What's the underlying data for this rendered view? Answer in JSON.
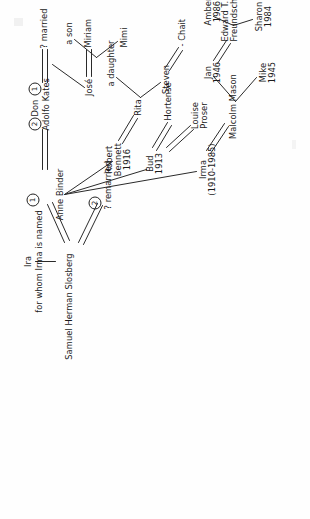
{
  "document": {
    "kind": "hand-drawn genealogy chart",
    "orientation": "rotated 90 degrees counter-clockwise on the page"
  },
  "people": {
    "ira": "Ira",
    "ira_note": "for whom Irma is named",
    "samuel": "Samuel Herman Slosberg",
    "remarried": "? remarried",
    "anne": "Anne Binder",
    "don": "Don",
    "adolfo": "Adolfo Kates",
    "qmarried": "? married",
    "jose": "José",
    "miriam": "Miriam",
    "mimi": "Mimi",
    "a_son": "a son",
    "robert": "Robert",
    "bennett": "Bennett",
    "bennett_year": "1916",
    "rita": "Rita",
    "steven": "Steven",
    "chait": "- Chait",
    "a_daughter": "a daughter",
    "bud": "Bud",
    "bud_year": "1913",
    "hortense": "Hortense",
    "louise": "Louise",
    "proser": "Proser",
    "irma": "Irma",
    "irma_years": "(1910-1985)",
    "malcolm": "Malcolm Mason",
    "mike": "Mike",
    "mike_year": "1945",
    "jan": "Jan",
    "jan_year": "1946",
    "edward": "Edward T.",
    "freundschuh": "Freundschuh",
    "sharon": "Sharon",
    "sharon_year": "1984",
    "amber": "Amber",
    "amber_year": "1986"
  },
  "marriage_numbers": {
    "anne_first": "1",
    "samuel_second": "2",
    "don_second": "2",
    "don_first": "1"
  },
  "colors": {
    "ink": "#1a1a1a",
    "line": "#2a2a2a",
    "paper": "#fefefe"
  }
}
